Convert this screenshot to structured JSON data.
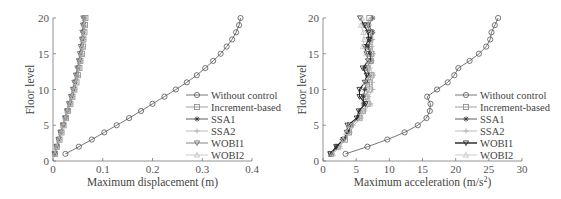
{
  "chart_data": [
    {
      "type": "line",
      "title": "",
      "xlabel": "Maximum displacement (m)",
      "ylabel": "Floor level",
      "xlim": [
        0,
        0.4
      ],
      "ylim": [
        0,
        20
      ],
      "xticks": [
        "0",
        "0.1",
        "0.2",
        "0.3",
        "0.4"
      ],
      "yticks": [
        "0",
        "5",
        "10",
        "15",
        "20"
      ],
      "grid": false,
      "legend_position": "lower right",
      "y": [
        1,
        2,
        3,
        4,
        5,
        6,
        7,
        8,
        9,
        10,
        11,
        12,
        13,
        14,
        15,
        16,
        17,
        18,
        19,
        20
      ],
      "series": [
        {
          "name": "Without control",
          "marker": "circle",
          "color": "#555555",
          "values": [
            0.025,
            0.052,
            0.078,
            0.103,
            0.128,
            0.153,
            0.177,
            0.2,
            0.224,
            0.247,
            0.269,
            0.289,
            0.306,
            0.322,
            0.337,
            0.349,
            0.36,
            0.368,
            0.374,
            0.377
          ]
        },
        {
          "name": "Increment-based",
          "marker": "square",
          "color": "#888888",
          "values": [
            0.004,
            0.008,
            0.013,
            0.017,
            0.021,
            0.026,
            0.03,
            0.035,
            0.039,
            0.043,
            0.047,
            0.05,
            0.053,
            0.055,
            0.058,
            0.06,
            0.061,
            0.063,
            0.064,
            0.065
          ]
        },
        {
          "name": "SSA1",
          "marker": "star",
          "color": "#333333",
          "values": [
            0.004,
            0.008,
            0.012,
            0.016,
            0.021,
            0.025,
            0.029,
            0.034,
            0.038,
            0.042,
            0.045,
            0.048,
            0.051,
            0.054,
            0.056,
            0.058,
            0.06,
            0.061,
            0.062,
            0.063
          ]
        },
        {
          "name": "SSA2",
          "marker": "plus",
          "color": "#aaaaaa",
          "values": [
            0.004,
            0.008,
            0.012,
            0.016,
            0.02,
            0.024,
            0.028,
            0.033,
            0.037,
            0.041,
            0.044,
            0.047,
            0.05,
            0.053,
            0.055,
            0.057,
            0.059,
            0.06,
            0.061,
            0.062
          ]
        },
        {
          "name": "WOBI1",
          "marker": "triangle-down",
          "color": "#666666",
          "values": [
            0.003,
            0.007,
            0.011,
            0.015,
            0.02,
            0.024,
            0.028,
            0.032,
            0.036,
            0.04,
            0.043,
            0.046,
            0.049,
            0.052,
            0.054,
            0.056,
            0.058,
            0.059,
            0.06,
            0.061
          ]
        },
        {
          "name": "WOBI2",
          "marker": "triangle-up",
          "color": "#bbbbbb",
          "values": [
            0.004,
            0.008,
            0.012,
            0.017,
            0.021,
            0.025,
            0.029,
            0.034,
            0.038,
            0.042,
            0.046,
            0.049,
            0.052,
            0.054,
            0.057,
            0.059,
            0.06,
            0.062,
            0.063,
            0.064
          ]
        }
      ]
    },
    {
      "type": "line",
      "title": "",
      "xlabel": "Maximum acceleration (m/s²)",
      "ylabel": "Floor level",
      "xlim": [
        0,
        30
      ],
      "ylim": [
        0,
        20
      ],
      "xticks": [
        "0",
        "5",
        "10",
        "15",
        "20",
        "25",
        "30"
      ],
      "yticks": [
        "0",
        "5",
        "10",
        "15",
        "20"
      ],
      "grid": false,
      "legend_position": "lower right",
      "y": [
        1,
        2,
        3,
        4,
        5,
        6,
        7,
        8,
        9,
        10,
        11,
        12,
        13,
        14,
        15,
        16,
        17,
        18,
        19,
        20
      ],
      "series": [
        {
          "name": "Without control",
          "marker": "circle",
          "color": "#555555",
          "values": [
            3.4,
            6.7,
            9.7,
            12.3,
            14.3,
            15.6,
            16.1,
            16.2,
            15.7,
            17.2,
            18.8,
            19.8,
            20.4,
            22.1,
            23.5,
            24.6,
            25.2,
            25.4,
            25.9,
            26.4
          ]
        },
        {
          "name": "Increment-based",
          "marker": "square",
          "color": "#888888",
          "values": [
            1.2,
            2.2,
            3.3,
            3.9,
            4.1,
            5.5,
            6.0,
            6.7,
            6.3,
            7.0,
            7.0,
            7.3,
            6.6,
            7.2,
            7.3,
            7.0,
            7.1,
            7.2,
            6.6,
            7.0
          ]
        },
        {
          "name": "SSA1",
          "marker": "star",
          "color": "#333333",
          "values": [
            1.3,
            2.1,
            2.9,
            3.8,
            4.2,
            5.3,
            5.6,
            6.1,
            6.1,
            6.3,
            6.6,
            7.0,
            6.5,
            7.2,
            7.1,
            6.8,
            7.2,
            7.5,
            6.9,
            7.5
          ]
        },
        {
          "name": "SSA2",
          "marker": "plus",
          "color": "#aaaaaa",
          "values": [
            1.4,
            2.5,
            3.4,
            4.1,
            4.6,
            5.8,
            6.3,
            7.2,
            6.9,
            7.5,
            7.4,
            7.6,
            7.1,
            7.4,
            7.6,
            7.4,
            7.5,
            7.3,
            6.8,
            7.3
          ]
        },
        {
          "name": "WOBI1",
          "marker": "triangle-down",
          "color": "#222222",
          "values": [
            1.1,
            2.0,
            3.1,
            3.6,
            3.7,
            5.1,
            5.4,
            6.4,
            5.5,
            5.5,
            6.3,
            6.6,
            6.0,
            6.8,
            6.6,
            6.3,
            6.9,
            6.8,
            6.2,
            5.6
          ]
        },
        {
          "name": "WOBI2",
          "marker": "triangle-up",
          "color": "#c0c0c0",
          "values": [
            1.5,
            2.6,
            3.0,
            3.5,
            4.0,
            5.6,
            5.9,
            7.1,
            6.7,
            7.0,
            6.4,
            7.2,
            6.8,
            6.8,
            6.5,
            6.0,
            6.2,
            6.1,
            5.7,
            5.9
          ]
        }
      ]
    }
  ],
  "charts": [
    {
      "xlabel": "Maximum displacement (m)",
      "ylabel": "Floor level"
    },
    {
      "xlabel_main": "Maximum acceleration (m/s",
      "xlabel_sup": "2",
      "xlabel_end": ")",
      "ylabel": "Floor level"
    }
  ]
}
